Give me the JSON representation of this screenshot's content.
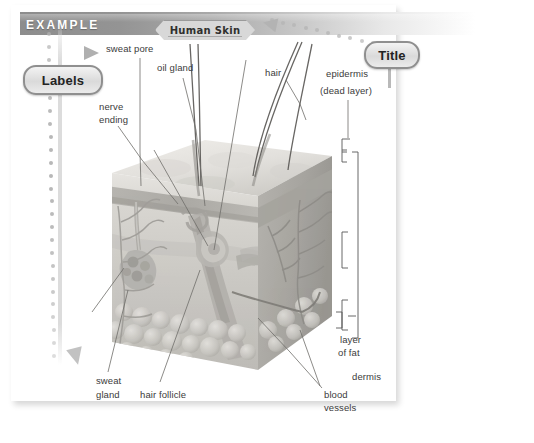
{
  "header": {
    "example_label": "Example",
    "bar_color": "#8d8d8d"
  },
  "banner": {
    "title_text": "Human Skin"
  },
  "callouts": {
    "labels_pill": "Labels",
    "title_pill": "Title"
  },
  "diagram": {
    "left_labels": [
      {
        "id": "sweat-pore",
        "text": "sweat pore",
        "x": 106,
        "y": 48
      },
      {
        "id": "oil-gland",
        "text": "oil gland",
        "x": 157,
        "y": 67
      },
      {
        "id": "hair",
        "text": "hair",
        "x": 265,
        "y": 70
      },
      {
        "id": "nerve",
        "text": "nerve",
        "x": 100,
        "y": 106
      },
      {
        "id": "ending",
        "text": "ending",
        "x": 100,
        "y": 118
      }
    ],
    "right_labels": [
      {
        "id": "epidermis",
        "text": "epidermis",
        "x": 327,
        "y": 73
      },
      {
        "id": "dead-layer",
        "text": "(dead layer)",
        "x": 320,
        "y": 90
      },
      {
        "id": "layer",
        "text": "layer",
        "x": 340,
        "y": 340
      },
      {
        "id": "of-fat",
        "text": "of fat",
        "x": 340,
        "y": 352
      },
      {
        "id": "dermis",
        "text": "dermis",
        "x": 352,
        "y": 375
      }
    ],
    "bottom_labels": [
      {
        "id": "sweat",
        "text": "sweat",
        "x": 96,
        "y": 380
      },
      {
        "id": "gland",
        "text": "gland",
        "x": 96,
        "y": 392
      },
      {
        "id": "hair-follicle",
        "text": "hair follicle",
        "x": 141,
        "y": 392
      },
      {
        "id": "blood",
        "text": "blood",
        "x": 325,
        "y": 393
      },
      {
        "id": "vessels",
        "text": "vessels",
        "x": 325,
        "y": 405
      }
    ]
  },
  "colors": {
    "bar_dark": "#8d8d8d",
    "pill_border": "#8f8f8f",
    "dot": "#b4b4b4",
    "label_text": "#3b3b3b",
    "skin_mid": "#b9b9b4",
    "skin_light": "#dedcd8",
    "skin_dark": "#9a9a95"
  }
}
